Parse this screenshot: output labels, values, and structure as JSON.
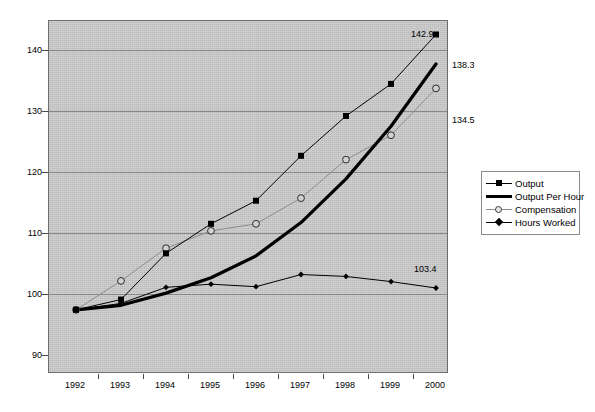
{
  "chart_data": {
    "type": "line",
    "title": "",
    "subtitle": "",
    "xlabel": "",
    "ylabel": "",
    "categories": [
      "1992",
      "1993",
      "1994",
      "1995",
      "1996",
      "1997",
      "1998",
      "1999",
      "2000"
    ],
    "ylim": [
      90,
      145
    ],
    "yticks": [
      90,
      100,
      110,
      120,
      130,
      140
    ],
    "grid": "horizontal",
    "legend_position": "right",
    "series": [
      {
        "name": "Output",
        "marker": "filled-square",
        "line": "thin",
        "color": "#000000",
        "values": [
          100.0,
          101.6,
          108.8,
          113.4,
          117.0,
          124.0,
          130.2,
          135.2,
          142.9
        ],
        "end_label": "142.9"
      },
      {
        "name": "Output Per Hour",
        "marker": "none",
        "line": "thick",
        "color": "#000000",
        "values": [
          100.0,
          100.7,
          102.6,
          105.0,
          108.4,
          113.6,
          120.4,
          128.6,
          138.3
        ],
        "end_label": "138.3"
      },
      {
        "name": "Compensation",
        "marker": "open-circle",
        "line": "thin-light",
        "color": "#8c8c8c",
        "values": [
          100.0,
          104.5,
          109.6,
          112.3,
          113.4,
          117.4,
          123.4,
          127.2,
          134.5
        ],
        "end_label": "134.5"
      },
      {
        "name": "Hours Worked",
        "marker": "filled-diamond",
        "line": "thin",
        "color": "#000000",
        "values": [
          100.0,
          101.0,
          103.5,
          104.0,
          103.6,
          105.5,
          105.2,
          104.4,
          103.4
        ],
        "end_label": "103.4"
      }
    ],
    "data_labels": [
      {
        "text": "142.9",
        "series": "Output",
        "category": "2000"
      },
      {
        "text": "138.3",
        "series": "Output Per Hour",
        "category": "2000"
      },
      {
        "text": "134.5",
        "series": "Compensation",
        "category": "2000"
      },
      {
        "text": "103.4",
        "series": "Hours Worked",
        "category": "2000"
      }
    ],
    "colors": {
      "plot_background": "#c3c3c3",
      "gridline": "#7d7d7d",
      "frame": "#6d6d6d",
      "text": "#000000",
      "legend_background": "#ffffff"
    }
  },
  "legend": {
    "items": [
      {
        "label": "Output"
      },
      {
        "label": "Output Per Hour"
      },
      {
        "label": "Compensation"
      },
      {
        "label": "Hours Worked"
      }
    ]
  }
}
